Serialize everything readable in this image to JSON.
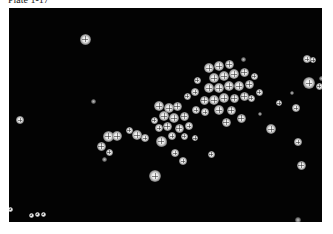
{
  "caption": "Plate 1-17",
  "micrograph": {
    "description": "Fluorescence micrograph of bright cell clusters on black background",
    "cells": [
      [
        76,
        31,
        11,
        0
      ],
      [
        84,
        93,
        5,
        1
      ],
      [
        11,
        112,
        8,
        0
      ],
      [
        120,
        122,
        7,
        0
      ],
      [
        99,
        128,
        11,
        0
      ],
      [
        108,
        128,
        10,
        0
      ],
      [
        92,
        138,
        9,
        0
      ],
      [
        100,
        144,
        7,
        0
      ],
      [
        95,
        151,
        5,
        1
      ],
      [
        128,
        127,
        10,
        0
      ],
      [
        136,
        130,
        8,
        0
      ],
      [
        150,
        98,
        10,
        0
      ],
      [
        160,
        100,
        10,
        0
      ],
      [
        168,
        98,
        9,
        0
      ],
      [
        155,
        108,
        10,
        0
      ],
      [
        165,
        110,
        10,
        0
      ],
      [
        175,
        108,
        9,
        0
      ],
      [
        158,
        118,
        9,
        0
      ],
      [
        170,
        120,
        9,
        0
      ],
      [
        180,
        118,
        8,
        0
      ],
      [
        150,
        120,
        8,
        0
      ],
      [
        145,
        112,
        7,
        0
      ],
      [
        163,
        128,
        8,
        0
      ],
      [
        175,
        128,
        7,
        0
      ],
      [
        186,
        130,
        6,
        0
      ],
      [
        155,
        135,
        6,
        1
      ],
      [
        200,
        60,
        10,
        0
      ],
      [
        210,
        58,
        10,
        0
      ],
      [
        220,
        56,
        9,
        0
      ],
      [
        205,
        70,
        10,
        0
      ],
      [
        215,
        68,
        10,
        0
      ],
      [
        225,
        66,
        10,
        0
      ],
      [
        235,
        64,
        9,
        0
      ],
      [
        200,
        80,
        10,
        0
      ],
      [
        210,
        80,
        10,
        0
      ],
      [
        220,
        78,
        10,
        0
      ],
      [
        230,
        78,
        10,
        0
      ],
      [
        240,
        76,
        9,
        0
      ],
      [
        195,
        92,
        9,
        0
      ],
      [
        205,
        92,
        10,
        0
      ],
      [
        215,
        90,
        10,
        0
      ],
      [
        225,
        90,
        9,
        0
      ],
      [
        235,
        88,
        9,
        0
      ],
      [
        210,
        102,
        10,
        0
      ],
      [
        222,
        102,
        9,
        0
      ],
      [
        196,
        104,
        8,
        0
      ],
      [
        186,
        84,
        8,
        0
      ],
      [
        188,
        72,
        7,
        0
      ],
      [
        232,
        110,
        9,
        0
      ],
      [
        217,
        114,
        9,
        0
      ],
      [
        245,
        68,
        7,
        0
      ],
      [
        242,
        90,
        7,
        0
      ],
      [
        250,
        84,
        7,
        0
      ],
      [
        187,
        102,
        8,
        0
      ],
      [
        178,
        88,
        7,
        0
      ],
      [
        152,
        133,
        11,
        0
      ],
      [
        146,
        168,
        12,
        0
      ],
      [
        166,
        145,
        8,
        0
      ],
      [
        174,
        153,
        8,
        0
      ],
      [
        202,
        146,
        7,
        0
      ],
      [
        262,
        121,
        10,
        0
      ],
      [
        270,
        95,
        6,
        0
      ],
      [
        287,
        100,
        8,
        0
      ],
      [
        298,
        51,
        8,
        0
      ],
      [
        300,
        75,
        12,
        0
      ],
      [
        304,
        52,
        6,
        0
      ],
      [
        310,
        78,
        7,
        0
      ],
      [
        289,
        134,
        8,
        0
      ],
      [
        292,
        157,
        9,
        0
      ],
      [
        283,
        85,
        4,
        1
      ],
      [
        251,
        106,
        4,
        1
      ],
      [
        234,
        51,
        5,
        1
      ],
      [
        312,
        70,
        5,
        1
      ],
      [
        1,
        201,
        5,
        0
      ],
      [
        22,
        207,
        5,
        0
      ],
      [
        28,
        206,
        5,
        0
      ],
      [
        34,
        206,
        5,
        0
      ],
      [
        289,
        212,
        6,
        1
      ]
    ]
  }
}
